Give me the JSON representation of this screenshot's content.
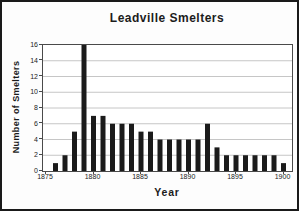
{
  "chart": {
    "title": "Leadville Smelters",
    "xlabel": "Year",
    "ylabel": "Number of Smelters"
  },
  "chart_data": {
    "type": "bar",
    "title": "Leadville Smelters",
    "xlabel": "Year",
    "ylabel": "Number of Smelters",
    "categories": [
      1875,
      1876,
      1877,
      1878,
      1879,
      1880,
      1881,
      1882,
      1883,
      1884,
      1885,
      1886,
      1887,
      1888,
      1889,
      1890,
      1891,
      1892,
      1893,
      1894,
      1895,
      1896,
      1897,
      1898,
      1899,
      1900
    ],
    "values": [
      0,
      1,
      2,
      5,
      16,
      7,
      7,
      6,
      6,
      6,
      5,
      5,
      4,
      4,
      4,
      4,
      4,
      6,
      3,
      2,
      2,
      2,
      2,
      2,
      2,
      1
    ],
    "ylim": [
      0,
      16
    ],
    "ytick_step": 2,
    "ytick_labels": [
      "0",
      "2",
      "4",
      "6",
      "8",
      "10",
      "12",
      "14",
      "16"
    ],
    "xtick_labels": [
      "1875",
      "1880",
      "1885",
      "1890",
      "1895",
      "1900"
    ],
    "grid": true,
    "legend": "none",
    "bar_color": "#1b1b1b",
    "grid_color": "#c6c6c6",
    "plot_border_color": "#4a4a4a",
    "background_color": "#ffffff"
  }
}
